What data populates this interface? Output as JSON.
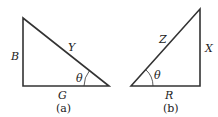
{
  "diagram": {
    "triangle_a": {
      "caption": "(a)",
      "vertical_side": "B",
      "hypotenuse": "Y",
      "base": "G",
      "angle": "θ"
    },
    "triangle_b": {
      "caption": "(b)",
      "hypotenuse": "Z",
      "vertical_side": "X",
      "base": "R",
      "angle": "θ"
    },
    "colors": {
      "stroke": "#333333",
      "text": "#222222",
      "background": "#ffffff"
    }
  }
}
